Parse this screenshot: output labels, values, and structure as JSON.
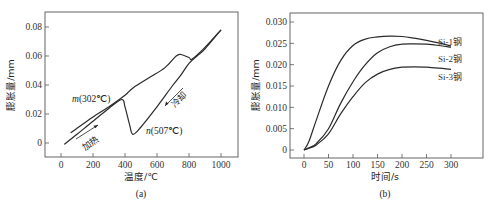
{
  "chart_data": [
    {
      "type": "line",
      "panel_label": "(a)",
      "title": "",
      "xlabel": "温度/℃",
      "ylabel": "膨胀量/mm",
      "xlim": [
        -100,
        1100
      ],
      "ylim": [
        -0.01,
        0.09
      ],
      "xticks": [
        0,
        200,
        400,
        600,
        800,
        1000
      ],
      "yticks": [
        0,
        0.02,
        0.04,
        0.06,
        0.08
      ],
      "xtick_labels": [
        "0",
        "200",
        "400",
        "600",
        "800",
        "1000"
      ],
      "ytick_labels": [
        "0",
        "0.02",
        "0.04",
        "0.06",
        "0.08"
      ],
      "grid": false,
      "series": [
        {
          "name": "加热",
          "x": [
            20,
            100,
            200,
            300,
            380,
            400,
            430,
            450,
            500,
            600,
            700,
            750,
            800,
            850,
            900,
            1000
          ],
          "y": [
            -0.001,
            0.006,
            0.015,
            0.024,
            0.03,
            0.025,
            0.012,
            0.006,
            0.011,
            0.025,
            0.04,
            0.047,
            0.055,
            0.06,
            0.065,
            0.078
          ]
        },
        {
          "name": "冷却",
          "x": [
            1000,
            900,
            820,
            800,
            750,
            720,
            650,
            550,
            450,
            400,
            300,
            200,
            60
          ],
          "y": [
            0.078,
            0.066,
            0.058,
            0.059,
            0.061,
            0.06,
            0.052,
            0.045,
            0.038,
            0.033,
            0.025,
            0.018,
            0.007
          ]
        }
      ],
      "annotations": [
        {
          "text": "m(302℃)",
          "x": 80,
          "y": 0.029
        },
        {
          "text": "n(507℃)",
          "x": 520,
          "y": 0.01
        },
        {
          "text": "加热",
          "x": 220,
          "y": 0.004,
          "arrow": "up-right"
        },
        {
          "text": "冷却",
          "x": 790,
          "y": 0.032,
          "arrow": "down-left"
        }
      ]
    },
    {
      "type": "line",
      "panel_label": "(b)",
      "title": "",
      "xlabel": "时间/s",
      "ylabel": "膨胀量/mm",
      "xlim": [
        -25,
        325
      ],
      "ylim": [
        -0.002,
        0.032
      ],
      "xticks": [
        0,
        50,
        100,
        150,
        200,
        250,
        300
      ],
      "yticks": [
        0,
        0.005,
        0.01,
        0.015,
        0.02,
        0.025,
        0.03
      ],
      "xtick_labels": [
        "0",
        "50",
        "100",
        "150",
        "200",
        "250",
        "300"
      ],
      "ytick_labels": [
        "0",
        "0.005",
        "0.010",
        "0.015",
        "0.020",
        "0.025",
        "0.030"
      ],
      "grid": false,
      "legend_position": "right, inline labels",
      "x": [
        0,
        10,
        25,
        50,
        75,
        100,
        125,
        150,
        175,
        200,
        225,
        250,
        275,
        300
      ],
      "series": [
        {
          "name": "Si-1钢",
          "values": [
            0,
            0.002,
            0.007,
            0.015,
            0.021,
            0.0245,
            0.026,
            0.0265,
            0.0267,
            0.0266,
            0.0262,
            0.0257,
            0.0251,
            0.0244
          ]
        },
        {
          "name": "Si-2钢",
          "values": [
            0,
            0.0005,
            0.0015,
            0.005,
            0.011,
            0.016,
            0.02,
            0.0228,
            0.0242,
            0.0248,
            0.0249,
            0.0248,
            0.0245,
            0.0241
          ]
        },
        {
          "name": "Si-3钢",
          "values": [
            0,
            0.0004,
            0.0012,
            0.0038,
            0.0085,
            0.0125,
            0.0158,
            0.0178,
            0.0189,
            0.0194,
            0.0195,
            0.0194,
            0.0192,
            0.0189
          ]
        }
      ]
    }
  ]
}
